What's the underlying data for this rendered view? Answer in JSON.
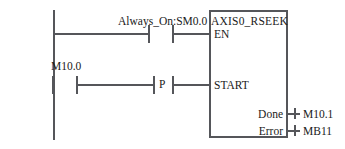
{
  "diagram": {
    "type": "plc-ladder-logic",
    "rungs": [
      {
        "id": "rung-1",
        "contact_label": "Always_On:SM0.0",
        "contact_type": "normally-open",
        "target_input": "EN"
      },
      {
        "id": "rung-2",
        "contact_label": "M10.0",
        "contact_type": "normally-open",
        "edge_label": "P",
        "edge_type": "positive-transition",
        "target_input": "START"
      }
    ],
    "function_block": {
      "title": "AXIS0_RSEEK",
      "inputs": [
        {
          "name": "EN"
        },
        {
          "name": "START"
        }
      ],
      "outputs": [
        {
          "name": "Done",
          "operand": "M10.1"
        },
        {
          "name": "Error",
          "operand": "MB11"
        }
      ]
    },
    "colors": {
      "line": "#55565a",
      "text": "#1a1a1a",
      "background": "#ffffff"
    }
  }
}
